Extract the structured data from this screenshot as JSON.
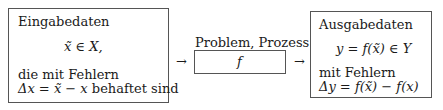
{
  "input_box": {
    "title": "Eingabedaten",
    "formula": "x̃ ∈ X,",
    "line1": "die mit Fehlern",
    "line2_math": "Δx = x̃ − x",
    "line2_text": " behaftet sind"
  },
  "process": {
    "label": "Problem, Prozess",
    "symbol": "f"
  },
  "output_box": {
    "title": "Ausgabedaten",
    "formula": "y = f(x̃) ∈ Y",
    "line1": "mit Fehlern",
    "line2_math": "Δy = f(x̃) − f(x)"
  },
  "arrows": {
    "left": "→",
    "right": "→"
  }
}
